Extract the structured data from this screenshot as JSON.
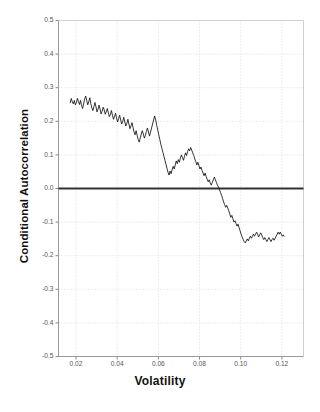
{
  "chart_data": {
    "type": "line",
    "title": "",
    "xlabel": "Volatility",
    "ylabel": "Conditional Autocorrelation",
    "xlim": [
      0.0115,
      0.1305
    ],
    "ylim": [
      -0.5,
      0.5
    ],
    "grid": true,
    "legend": null,
    "xticks": [
      0.02,
      0.04,
      0.06,
      0.08,
      0.1,
      0.12
    ],
    "xtick_labels": [
      "0.02",
      "0.04",
      "0.06",
      "0.08",
      "0.10",
      "0.12"
    ],
    "yticks": [
      0.5,
      0.4,
      0.3,
      0.2,
      0.1,
      0.0,
      -0.1,
      -0.2,
      -0.3,
      -0.4,
      -0.5
    ],
    "ytick_labels": [
      "0.5",
      "0.4",
      "0.3",
      "0.2",
      "0.1",
      "0.0",
      "-0.1",
      "-0.2",
      "-0.3",
      "-0.4",
      "-0.5"
    ],
    "reference_line": {
      "y": 0.0,
      "color": "#333333",
      "width": 2.0
    },
    "series": [
      {
        "name": "Conditional Autocorrelation",
        "color": "#111111",
        "x": [
          0.0172,
          0.0177,
          0.0182,
          0.0187,
          0.0192,
          0.0197,
          0.0202,
          0.0207,
          0.0212,
          0.0217,
          0.0222,
          0.0227,
          0.0232,
          0.0237,
          0.0242,
          0.0247,
          0.0252,
          0.0257,
          0.0262,
          0.0267,
          0.0272,
          0.0277,
          0.0282,
          0.0287,
          0.0292,
          0.0297,
          0.0302,
          0.0307,
          0.0312,
          0.0317,
          0.0322,
          0.0327,
          0.0332,
          0.0337,
          0.0342,
          0.0347,
          0.0352,
          0.0357,
          0.0362,
          0.0367,
          0.0372,
          0.0377,
          0.0382,
          0.0387,
          0.0392,
          0.0397,
          0.0402,
          0.0407,
          0.0412,
          0.0417,
          0.0422,
          0.0427,
          0.0432,
          0.0437,
          0.0442,
          0.0447,
          0.0452,
          0.0457,
          0.0462,
          0.0467,
          0.0472,
          0.0477,
          0.0482,
          0.0487,
          0.0492,
          0.0497,
          0.0502,
          0.0507,
          0.0512,
          0.0517,
          0.0522,
          0.0527,
          0.0532,
          0.0537,
          0.0542,
          0.0547,
          0.0552,
          0.0557,
          0.0562,
          0.0567,
          0.0572,
          0.0577,
          0.0582,
          0.0587,
          0.0592,
          0.0597,
          0.0602,
          0.0607,
          0.0612,
          0.0617,
          0.0622,
          0.0627,
          0.0632,
          0.0637,
          0.0642,
          0.0647,
          0.0652,
          0.0657,
          0.0662,
          0.0667,
          0.0672,
          0.0677,
          0.0682,
          0.0687,
          0.0692,
          0.0697,
          0.0702,
          0.0707,
          0.0712,
          0.0717,
          0.0722,
          0.0727,
          0.0732,
          0.0737,
          0.0742,
          0.0747,
          0.0752,
          0.0757,
          0.0762,
          0.0767,
          0.0772,
          0.0777,
          0.0782,
          0.0787,
          0.0792,
          0.0797,
          0.0802,
          0.0807,
          0.0812,
          0.0817,
          0.0822,
          0.0827,
          0.0832,
          0.0837,
          0.0842,
          0.0847,
          0.0852,
          0.0857,
          0.0862,
          0.0867,
          0.0872,
          0.0877,
          0.0882,
          0.0887,
          0.0892,
          0.0897,
          0.0902,
          0.0907,
          0.0912,
          0.0917,
          0.0922,
          0.0927,
          0.0932,
          0.0937,
          0.0942,
          0.0947,
          0.0952,
          0.0957,
          0.0962,
          0.0967,
          0.0972,
          0.0977,
          0.0982,
          0.0987,
          0.0992,
          0.0997,
          0.1002,
          0.1007,
          0.1012,
          0.1017,
          0.1022,
          0.1027,
          0.1032,
          0.1037,
          0.1042,
          0.1047,
          0.1052,
          0.1057,
          0.1062,
          0.1067,
          0.1072,
          0.1077,
          0.1082,
          0.1087,
          0.1092,
          0.1097,
          0.1102,
          0.1107,
          0.1112,
          0.1117,
          0.1122,
          0.1127,
          0.1132,
          0.1137,
          0.1142,
          0.1147,
          0.1152,
          0.1157,
          0.1162,
          0.1167,
          0.1172,
          0.1177,
          0.1182,
          0.1187,
          0.1192,
          0.1197,
          0.1202,
          0.1207,
          0.121
        ],
        "y": [
          0.255,
          0.268,
          0.258,
          0.252,
          0.262,
          0.249,
          0.256,
          0.268,
          0.258,
          0.25,
          0.262,
          0.247,
          0.238,
          0.252,
          0.266,
          0.275,
          0.262,
          0.249,
          0.258,
          0.27,
          0.252,
          0.24,
          0.232,
          0.244,
          0.256,
          0.243,
          0.228,
          0.236,
          0.248,
          0.236,
          0.222,
          0.23,
          0.242,
          0.234,
          0.221,
          0.228,
          0.238,
          0.226,
          0.214,
          0.22,
          0.232,
          0.218,
          0.206,
          0.214,
          0.224,
          0.21,
          0.198,
          0.208,
          0.218,
          0.204,
          0.192,
          0.2,
          0.212,
          0.198,
          0.186,
          0.194,
          0.206,
          0.192,
          0.178,
          0.186,
          0.196,
          0.182,
          0.168,
          0.16,
          0.172,
          0.158,
          0.146,
          0.138,
          0.15,
          0.162,
          0.172,
          0.162,
          0.15,
          0.158,
          0.17,
          0.18,
          0.168,
          0.156,
          0.168,
          0.18,
          0.192,
          0.204,
          0.216,
          0.204,
          0.188,
          0.174,
          0.16,
          0.146,
          0.132,
          0.12,
          0.108,
          0.096,
          0.084,
          0.072,
          0.06,
          0.048,
          0.04,
          0.052,
          0.044,
          0.056,
          0.066,
          0.058,
          0.07,
          0.082,
          0.074,
          0.086,
          0.078,
          0.09,
          0.1,
          0.092,
          0.084,
          0.096,
          0.106,
          0.098,
          0.11,
          0.118,
          0.112,
          0.122,
          0.114,
          0.106,
          0.098,
          0.088,
          0.08,
          0.07,
          0.078,
          0.068,
          0.058,
          0.064,
          0.054,
          0.046,
          0.038,
          0.046,
          0.036,
          0.028,
          0.02,
          0.026,
          0.016,
          0.01,
          0.018,
          0.026,
          0.034,
          0.026,
          0.018,
          0.01,
          0.004,
          -0.004,
          -0.012,
          -0.02,
          -0.03,
          -0.04,
          -0.048,
          -0.056,
          -0.05,
          -0.058,
          -0.066,
          -0.076,
          -0.086,
          -0.08,
          -0.09,
          -0.1,
          -0.096,
          -0.104,
          -0.112,
          -0.106,
          -0.116,
          -0.126,
          -0.136,
          -0.144,
          -0.152,
          -0.158,
          -0.162,
          -0.156,
          -0.15,
          -0.156,
          -0.148,
          -0.142,
          -0.148,
          -0.142,
          -0.136,
          -0.142,
          -0.136,
          -0.13,
          -0.136,
          -0.144,
          -0.138,
          -0.132,
          -0.138,
          -0.146,
          -0.152,
          -0.146,
          -0.152,
          -0.158,
          -0.152,
          -0.146,
          -0.152,
          -0.158,
          -0.152,
          -0.148,
          -0.154,
          -0.148,
          -0.142,
          -0.136,
          -0.13,
          -0.136,
          -0.13,
          -0.136,
          -0.142,
          -0.138,
          -0.142
        ]
      }
    ]
  }
}
